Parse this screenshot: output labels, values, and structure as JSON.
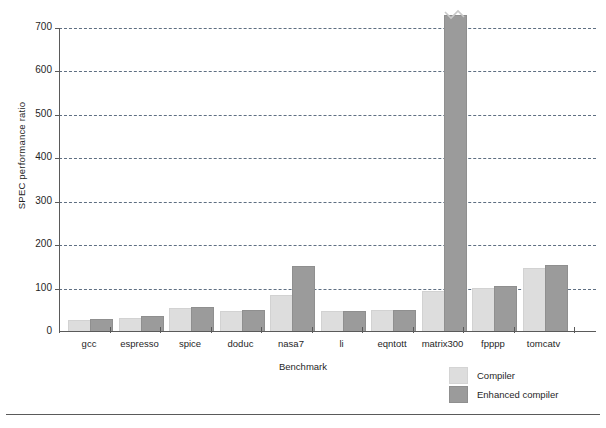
{
  "chart_data": {
    "type": "bar",
    "title": "",
    "xlabel": "Benchmark",
    "ylabel": "SPEC performance ratio",
    "categories": [
      "gcc",
      "espresso",
      "spice",
      "doduc",
      "nasa7",
      "li",
      "eqntott",
      "matrix300",
      "fpppp",
      "tomcatv"
    ],
    "series": [
      {
        "name": "Compiler",
        "color": "#dddddd",
        "values": [
          23,
          28,
          50,
          43,
          80,
          43,
          45,
          90,
          97,
          143
        ]
      },
      {
        "name": "Enhanced compiler",
        "color": "#9b9b9b",
        "values": [
          25,
          32,
          52,
          45,
          148,
          44,
          47,
          725,
          101,
          150
        ]
      }
    ],
    "ylim": [
      0,
      700
    ],
    "yticks": [
      0,
      100,
      200,
      300,
      400,
      500,
      600,
      700
    ],
    "ytick_labels": [
      "0",
      "100",
      "200",
      "300",
      "400",
      "500",
      "600",
      "700"
    ],
    "grid": "horizontal-dashed",
    "legend_position": "bottom-right",
    "annotations": [
      {
        "text": "axis-break",
        "note": "matrix300 enhanced-compiler bar is clipped at the top of the axis with a break squiggle",
        "series": "Enhanced compiler",
        "category": "matrix300"
      }
    ]
  },
  "legend": {
    "items": [
      {
        "label": "Compiler",
        "swatch": "light"
      },
      {
        "label": "Enhanced compiler",
        "swatch": "dark"
      }
    ]
  },
  "footer": {
    "ghost_text": ""
  }
}
